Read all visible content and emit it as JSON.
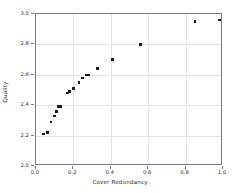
{
  "chart_data": {
    "type": "scatter",
    "title": "",
    "xlabel": "Cover Redundancy",
    "ylabel": "Quality",
    "xlim": [
      0.0,
      1.0
    ],
    "ylim": [
      2.0,
      3.0
    ],
    "xticks": [
      "0.0",
      "0.2",
      "0.4",
      "0.6",
      "0.8",
      "1.0"
    ],
    "xtick_values": [
      0.0,
      0.2,
      0.4,
      0.6,
      0.8,
      1.0
    ],
    "yticks": [
      "2.0",
      "2.2",
      "2.4",
      "2.6",
      "2.8",
      "3.0"
    ],
    "ytick_values": [
      2.0,
      2.2,
      2.4,
      2.6,
      2.8,
      3.0
    ],
    "grid": true,
    "legend": null,
    "marker": "square",
    "marker_color": "#1a1a1a",
    "points": [
      {
        "x": 0.04,
        "y": 2.21
      },
      {
        "x": 0.06,
        "y": 2.22
      },
      {
        "x": 0.08,
        "y": 2.29
      },
      {
        "x": 0.1,
        "y": 2.33
      },
      {
        "x": 0.11,
        "y": 2.36
      },
      {
        "x": 0.12,
        "y": 2.39
      },
      {
        "x": 0.13,
        "y": 2.39
      },
      {
        "x": 0.17,
        "y": 2.48
      },
      {
        "x": 0.18,
        "y": 2.49
      },
      {
        "x": 0.2,
        "y": 2.51
      },
      {
        "x": 0.23,
        "y": 2.55
      },
      {
        "x": 0.25,
        "y": 2.58
      },
      {
        "x": 0.27,
        "y": 2.6
      },
      {
        "x": 0.28,
        "y": 2.6
      },
      {
        "x": 0.33,
        "y": 2.64
      },
      {
        "x": 0.41,
        "y": 2.7
      },
      {
        "x": 0.56,
        "y": 2.8
      },
      {
        "x": 0.85,
        "y": 2.95
      },
      {
        "x": 0.98,
        "y": 2.96
      }
    ]
  }
}
